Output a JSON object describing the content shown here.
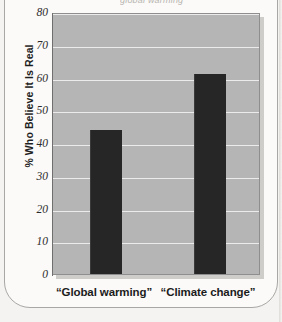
{
  "figure": {
    "cropped_top_text": "global warming",
    "background_color": "#f4f3f1",
    "plot_background_color": "#b5b5b5",
    "bar_color": "#262626",
    "gridline_color": "#eceaea"
  },
  "chart_data": {
    "type": "bar",
    "title": "",
    "xlabel": "",
    "ylabel": "% Who Believe It Is Real",
    "categories": [
      "“Global warming”",
      "“Climate change”"
    ],
    "values": [
      44,
      61
    ],
    "ylim": [
      0,
      80
    ],
    "yticks": [
      0,
      10,
      20,
      30,
      40,
      50,
      60,
      70,
      80
    ],
    "ytick_labels": [
      "0",
      "10",
      "20",
      "30",
      "40",
      "50",
      "60",
      "70",
      "80"
    ],
    "grid": true,
    "legend": false,
    "legend_position": "none",
    "orientation": "vertical"
  }
}
